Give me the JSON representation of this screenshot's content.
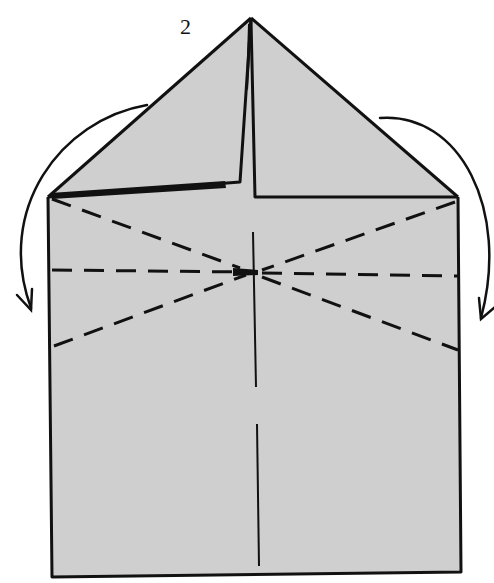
{
  "diagram": {
    "type": "origami-fold-step",
    "step_number": "2",
    "colors": {
      "paper_fill": "#cfcfcf",
      "line": "#111111",
      "background": "#ffffff"
    },
    "elements": {
      "paper_body": "square base with triangular top flaps",
      "valley_folds": [
        "diagonal from top-left corner to center",
        "horizontal through center",
        "diagonal from bottom-left to center",
        "diagonal from top-right corner to center",
        "diagonal from center to bottom-right"
      ],
      "mountain_fold": "vertical center line (broken)",
      "arrows": [
        "left curved arrow: fold top-left flap down",
        "right curved arrow: fold top-right flap down"
      ]
    }
  }
}
